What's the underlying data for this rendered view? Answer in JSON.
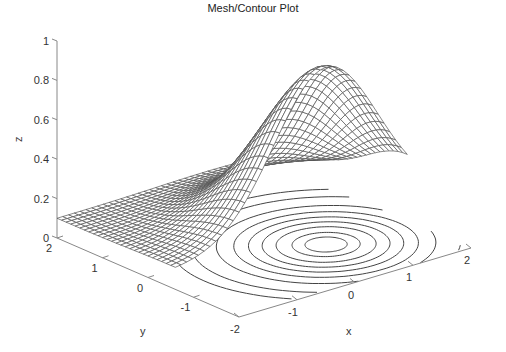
{
  "chart_data": {
    "type": "mesh_contour_3d",
    "title": "Mesh/Contour Plot",
    "xlabel": "x",
    "ylabel": "y",
    "zlabel": "z",
    "xlim": [
      -2,
      2
    ],
    "ylim": [
      -2,
      2
    ],
    "zlim": [
      0,
      1
    ],
    "xticks": [
      -2,
      -1,
      0,
      1,
      2
    ],
    "yticks": [
      2,
      1,
      0,
      -1
    ],
    "zticks": [
      0,
      0.2,
      0.4,
      0.6,
      0.8,
      1
    ],
    "zticklabels": [
      "0",
      "0.2",
      "0.4",
      "0.6",
      "0.8",
      "1"
    ],
    "surface": {
      "description": "Gaussian bump z = offset + amp*exp(-((x-cx)^2+(y-cy)^2)/s2)",
      "offset": 0.1,
      "amp": 0.8,
      "cx": 0.6,
      "cy": -0.6,
      "s2": 1.6,
      "peak_z": 0.9
    },
    "mesh_y_range": [
      -0.6,
      2
    ],
    "mesh_grid_n": 40,
    "contour_levels": [
      0.15,
      0.2,
      0.3,
      0.4,
      0.5,
      0.6,
      0.7,
      0.8,
      0.86
    ],
    "grid": false,
    "colors": {
      "mesh": "#555555",
      "axis": "#888888",
      "contour": "#444444"
    }
  }
}
